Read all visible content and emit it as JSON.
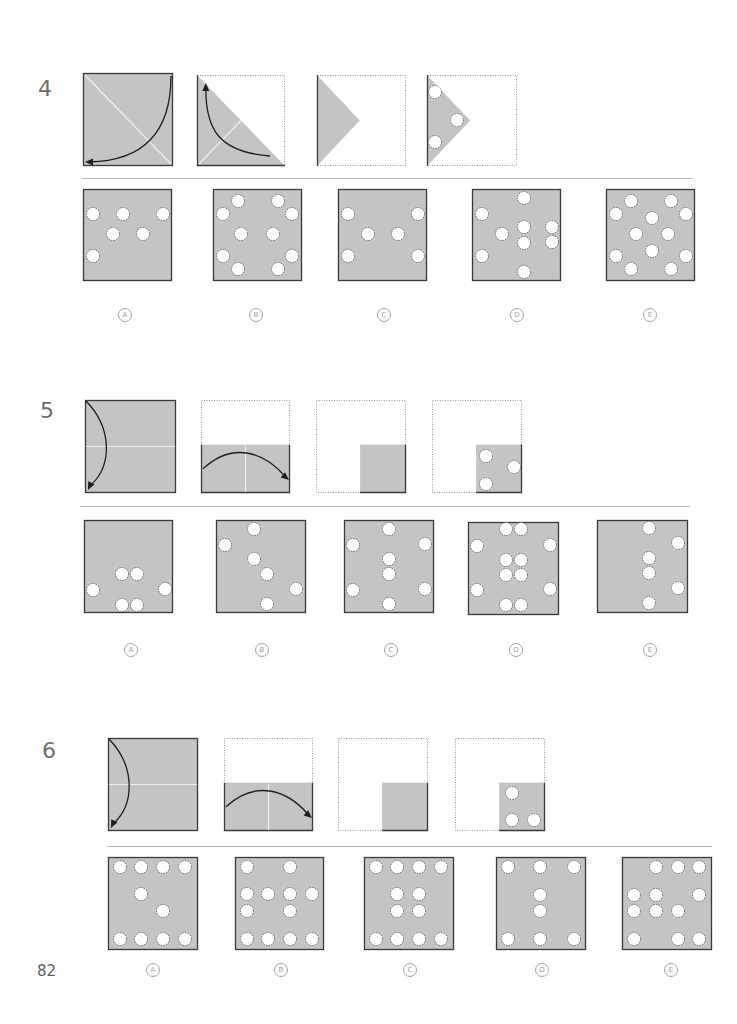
{
  "page": {
    "number": "82"
  },
  "colors": {
    "paper": "#c4c4c4",
    "border": "#3a3a3a",
    "dotted": "#9a9a9a",
    "crease": "#eeeeee",
    "hole_fill": "#ffffff",
    "hole_edge": "#555555",
    "arrow": "#1e1e1e"
  },
  "questions": [
    {
      "number": "4",
      "number_pos": [
        38,
        76
      ],
      "divider": {
        "x": 82,
        "y": 178,
        "w": 610
      },
      "steps": [
        {
          "x": 83,
          "y": 73,
          "w": 90,
          "h": 93,
          "kind": "full",
          "crease": "diag",
          "arrow": "diag-fold"
        },
        {
          "x": 197,
          "y": 75,
          "w": 88,
          "h": 91,
          "kind": "triangle",
          "crease": "tri",
          "arrow": "tri-fold"
        },
        {
          "x": 317,
          "y": 75,
          "w": 89,
          "h": 91,
          "kind": "chevron"
        },
        {
          "x": 427,
          "y": 75,
          "w": 90,
          "h": 91,
          "kind": "chevron",
          "holes": [
            [
              8,
              17
            ],
            [
              30,
              45
            ],
            [
              8,
              67
            ]
          ]
        }
      ],
      "options": [
        {
          "label": "A",
          "x": 83,
          "y": 189,
          "w": 89,
          "h": 92,
          "label_pos": [
            118,
            308
          ],
          "holes": [
            [
              10,
              25
            ],
            [
              40,
              25
            ],
            [
              80,
              25
            ],
            [
              30,
              45
            ],
            [
              60,
              45
            ],
            [
              10,
              67
            ]
          ]
        },
        {
          "label": "B",
          "x": 213,
          "y": 189,
          "w": 89,
          "h": 92,
          "label_pos": [
            249,
            308
          ],
          "holes": [
            [
              25,
              12
            ],
            [
              65,
              12
            ],
            [
              10,
              25
            ],
            [
              79,
              25
            ],
            [
              28,
              45
            ],
            [
              60,
              45
            ],
            [
              10,
              67
            ],
            [
              79,
              67
            ],
            [
              25,
              80
            ],
            [
              65,
              80
            ]
          ]
        },
        {
          "label": "C",
          "x": 338,
          "y": 189,
          "w": 89,
          "h": 92,
          "label_pos": [
            377,
            308
          ],
          "holes": [
            [
              10,
              25
            ],
            [
              80,
              25
            ],
            [
              30,
              45
            ],
            [
              60,
              45
            ],
            [
              10,
              67
            ],
            [
              80,
              67
            ]
          ]
        },
        {
          "label": "D",
          "x": 472,
          "y": 189,
          "w": 89,
          "h": 92,
          "label_pos": [
            510,
            308
          ],
          "holes": [
            [
              52,
              9
            ],
            [
              10,
              25
            ],
            [
              52,
              38
            ],
            [
              80,
              38
            ],
            [
              30,
              45
            ],
            [
              52,
              54
            ],
            [
              80,
              53
            ],
            [
              10,
              67
            ],
            [
              52,
              83
            ]
          ]
        },
        {
          "label": "E",
          "x": 606,
          "y": 189,
          "w": 89,
          "h": 92,
          "label_pos": [
            643,
            308
          ],
          "holes": [
            [
              25,
              12
            ],
            [
              65,
              12
            ],
            [
              10,
              25
            ],
            [
              80,
              25
            ],
            [
              46,
              29
            ],
            [
              30,
              45
            ],
            [
              62,
              45
            ],
            [
              46,
              62
            ],
            [
              10,
              67
            ],
            [
              80,
              67
            ],
            [
              25,
              80
            ],
            [
              65,
              80
            ]
          ]
        }
      ]
    },
    {
      "number": "5",
      "number_pos": [
        40,
        398
      ],
      "divider": {
        "x": 80,
        "y": 506,
        "w": 610
      },
      "steps": [
        {
          "x": 85,
          "y": 400,
          "w": 91,
          "h": 93,
          "kind": "full",
          "crease": "horiz",
          "arrow": "vert-fold"
        },
        {
          "x": 201,
          "y": 400,
          "w": 89,
          "h": 93,
          "kind": "bottom-half",
          "crease": "vert-half",
          "arrow": "horiz-fold"
        },
        {
          "x": 316,
          "y": 400,
          "w": 90,
          "h": 93,
          "kind": "quarter"
        },
        {
          "x": 432,
          "y": 400,
          "w": 90,
          "h": 93,
          "kind": "quarter",
          "holes": [
            [
              54,
              56
            ],
            [
              82,
              67
            ],
            [
              54,
              84
            ]
          ]
        }
      ],
      "options": [
        {
          "label": "A",
          "x": 84,
          "y": 520,
          "w": 89,
          "h": 93,
          "label_pos": [
            124,
            643
          ],
          "holes": [
            [
              38,
              54
            ],
            [
              53,
              54
            ],
            [
              9,
              70
            ],
            [
              81,
              69
            ],
            [
              38,
              85
            ],
            [
              53,
              85
            ]
          ]
        },
        {
          "label": "B",
          "x": 216,
          "y": 520,
          "w": 90,
          "h": 93,
          "label_pos": [
            255,
            643
          ],
          "holes": [
            [
              38,
              9
            ],
            [
              9,
              25
            ],
            [
              38,
              39
            ],
            [
              51,
              54
            ],
            [
              80,
              69
            ],
            [
              51,
              84
            ]
          ]
        },
        {
          "label": "C",
          "x": 344,
          "y": 520,
          "w": 90,
          "h": 93,
          "label_pos": [
            384,
            643
          ],
          "holes": [
            [
              45,
              9
            ],
            [
              9,
              25
            ],
            [
              81,
              24
            ],
            [
              45,
              39
            ],
            [
              45,
              54
            ],
            [
              9,
              70
            ],
            [
              81,
              69
            ],
            [
              45,
              84
            ]
          ]
        },
        {
          "label": "D",
          "x": 468,
          "y": 522,
          "w": 91,
          "h": 93,
          "label_pos": [
            509,
            643
          ],
          "holes": [
            [
              38,
              7
            ],
            [
              53,
              7
            ],
            [
              9,
              24
            ],
            [
              82,
              23
            ],
            [
              38,
              38
            ],
            [
              53,
              38
            ],
            [
              38,
              53
            ],
            [
              53,
              53
            ],
            [
              9,
              68
            ],
            [
              82,
              67
            ],
            [
              38,
              83
            ],
            [
              53,
              83
            ]
          ]
        },
        {
          "label": "E",
          "x": 597,
          "y": 520,
          "w": 91,
          "h": 93,
          "label_pos": [
            643,
            643
          ],
          "holes": [
            [
              52,
              8
            ],
            [
              81,
              23
            ],
            [
              52,
              38
            ],
            [
              52,
              53
            ],
            [
              81,
              68
            ],
            [
              52,
              83
            ]
          ]
        }
      ]
    },
    {
      "number": "6",
      "number_pos": [
        42,
        738
      ],
      "divider": {
        "x": 107,
        "y": 846,
        "w": 605
      },
      "steps": [
        {
          "x": 108,
          "y": 738,
          "w": 90,
          "h": 93,
          "kind": "full",
          "crease": "horiz",
          "arrow": "vert-fold"
        },
        {
          "x": 224,
          "y": 738,
          "w": 89,
          "h": 93,
          "kind": "bottom-half",
          "crease": "vert-half",
          "arrow": "horiz-fold"
        },
        {
          "x": 338,
          "y": 738,
          "w": 90,
          "h": 93,
          "kind": "quarter"
        },
        {
          "x": 455,
          "y": 738,
          "w": 90,
          "h": 93,
          "kind": "quarter",
          "holes": [
            [
              57,
              55
            ],
            [
              57,
              82
            ],
            [
              79,
              82
            ]
          ]
        }
      ],
      "options": [
        {
          "label": "A",
          "x": 108,
          "y": 857,
          "w": 90,
          "h": 93,
          "label_pos": [
            146,
            963
          ],
          "holes": [
            [
              12,
              10
            ],
            [
              33,
              10
            ],
            [
              55,
              10
            ],
            [
              77,
              10
            ],
            [
              33,
              37
            ],
            [
              55,
              54
            ],
            [
              12,
              82
            ],
            [
              33,
              82
            ],
            [
              55,
              82
            ],
            [
              77,
              82
            ]
          ]
        },
        {
          "label": "B",
          "x": 235,
          "y": 857,
          "w": 89,
          "h": 93,
          "label_pos": [
            274,
            963
          ],
          "holes": [
            [
              12,
              10
            ],
            [
              55,
              10
            ],
            [
              12,
              37
            ],
            [
              33,
              37
            ],
            [
              55,
              37
            ],
            [
              77,
              37
            ],
            [
              12,
              54
            ],
            [
              55,
              54
            ],
            [
              12,
              82
            ],
            [
              33,
              82
            ],
            [
              55,
              82
            ],
            [
              77,
              82
            ]
          ]
        },
        {
          "label": "C",
          "x": 364,
          "y": 857,
          "w": 90,
          "h": 93,
          "label_pos": [
            403,
            963
          ],
          "holes": [
            [
              12,
              10
            ],
            [
              33,
              10
            ],
            [
              55,
              10
            ],
            [
              77,
              10
            ],
            [
              33,
              37
            ],
            [
              55,
              37
            ],
            [
              33,
              54
            ],
            [
              55,
              54
            ],
            [
              12,
              82
            ],
            [
              33,
              82
            ],
            [
              55,
              82
            ],
            [
              77,
              82
            ]
          ]
        },
        {
          "label": "D",
          "x": 496,
          "y": 857,
          "w": 90,
          "h": 93,
          "label_pos": [
            535,
            963
          ],
          "holes": [
            [
              12,
              10
            ],
            [
              44,
              10
            ],
            [
              78,
              10
            ],
            [
              44,
              38
            ],
            [
              44,
              54
            ],
            [
              12,
              82
            ],
            [
              44,
              82
            ],
            [
              78,
              82
            ]
          ]
        },
        {
          "label": "E",
          "x": 622,
          "y": 857,
          "w": 90,
          "h": 93,
          "label_pos": [
            664,
            963
          ],
          "holes": [
            [
              34,
              10
            ],
            [
              56,
              10
            ],
            [
              77,
              10
            ],
            [
              12,
              38
            ],
            [
              34,
              38
            ],
            [
              77,
              38
            ],
            [
              12,
              54
            ],
            [
              34,
              54
            ],
            [
              56,
              54
            ],
            [
              12,
              82
            ],
            [
              56,
              82
            ],
            [
              77,
              82
            ]
          ]
        }
      ]
    }
  ]
}
